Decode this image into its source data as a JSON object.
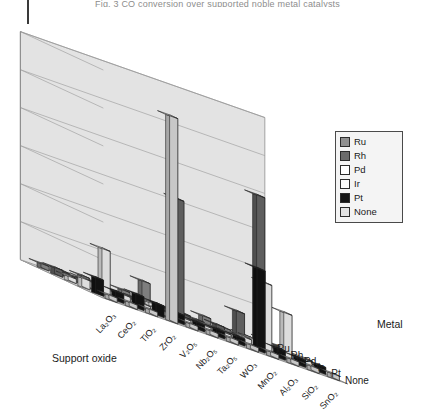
{
  "figure": {
    "cropped_header_text": "Fig. 3  CO conversion over supported noble metal catalysts",
    "y_axis_label": "Conversion of CO at 353 K (%)",
    "x_axis_label": "Support oxide",
    "z_axis_label": "Metal"
  },
  "legend": {
    "entries": [
      {
        "label": "Ru",
        "color": "#8f8f8f"
      },
      {
        "label": "Rh",
        "color": "#6b6b6b"
      },
      {
        "label": "Pd",
        "color": "#ffffff"
      },
      {
        "label": "Ir",
        "color": "#fbfbfb"
      },
      {
        "label": "Pt",
        "color": "#141414"
      },
      {
        "label": "None",
        "color": "#e2e2e2"
      }
    ]
  },
  "chart_data": {
    "type": "bar",
    "title": "",
    "subtitle": "",
    "xlabel": "Support oxide",
    "ylabel": "Conversion of CO at 353 K (%)",
    "zlabel": "Metal",
    "ylim": [
      0,
      100
    ],
    "grid": true,
    "gridlines": [
      0,
      16.7,
      33.3,
      50,
      66.7,
      83.3,
      100
    ],
    "legend_position": "right",
    "projection": "3d-bar",
    "categories": [
      "La2O3",
      "CeO2",
      "TiO2",
      "ZrO2",
      "V2O5",
      "Nb2O5",
      "Ta2O5",
      "WO3",
      "MnO2",
      "Al2O3",
      "SiO2",
      "SnO2"
    ],
    "categories_display": [
      "La₂O₃",
      "CeO₂",
      "TiO₂",
      "ZrO₂",
      "V₂O₅",
      "Nb₂O₅",
      "Ta₂O₅",
      "WO₃",
      "MnO₂",
      "Al₂O₃",
      "SiO₂",
      "SnO₂"
    ],
    "depth_categories": [
      "Ru",
      "Rh",
      "Pd",
      "Ir",
      "Pt",
      "None"
    ],
    "series": [
      {
        "name": "Ru",
        "color": "#8f8f8f",
        "values": [
          2,
          2,
          3,
          2,
          3,
          10,
          2,
          2,
          4,
          2,
          2,
          3
        ]
      },
      {
        "name": "Rh",
        "color": "#6b6b6b",
        "values": [
          3,
          2,
          2,
          2,
          2,
          2,
          52,
          2,
          3,
          12,
          66,
          3
        ]
      },
      {
        "name": "Pd",
        "color": "#ffffff",
        "values": [
          2,
          3,
          2,
          2,
          3,
          2,
          2,
          2,
          2,
          3,
          2,
          2
        ]
      },
      {
        "name": "Ir",
        "color": "#fbfbfb",
        "values": [
          4,
          20,
          3,
          2,
          2,
          2,
          2,
          2,
          3,
          30,
          20,
          3
        ]
      },
      {
        "name": "Pt",
        "color": "#141414",
        "values": [
          7,
          4,
          6,
          5,
          4,
          3,
          3,
          3,
          36,
          4,
          3,
          3
        ]
      },
      {
        "name": "None",
        "color": "#e2e2e2",
        "values": [
          2,
          2,
          2,
          90,
          2,
          2,
          2,
          2,
          2,
          2,
          2,
          2
        ]
      }
    ]
  }
}
